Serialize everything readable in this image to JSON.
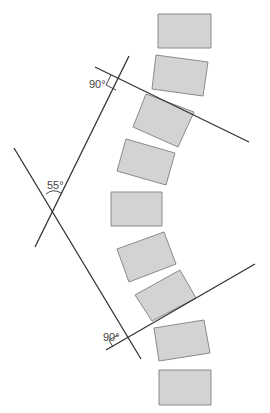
{
  "diagram": {
    "type": "cobb-angle-spine-diagram",
    "labels": {
      "upper_right_angle": "90°",
      "cobb_angle": "55°",
      "lower_right_angle": "90°"
    },
    "colors": {
      "vertebra_fill": "#d3d3d3",
      "vertebra_stroke": "#8a8a8a",
      "line": "#333333"
    },
    "vertebrae_count": 9
  }
}
